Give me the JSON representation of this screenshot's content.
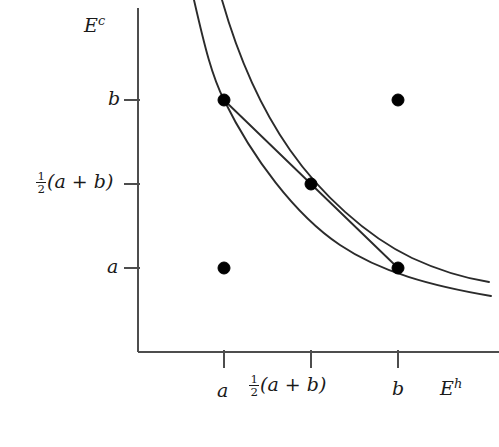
{
  "figure": {
    "type": "mathematical-diagram"
  },
  "axes": {
    "y_axis_label": "E",
    "y_axis_superscript": "c",
    "x_axis_label": "E",
    "x_axis_superscript": "h",
    "line_color": "#4d4d4d"
  },
  "yticks": [
    {
      "id": "b",
      "label": "b",
      "kind": "plain",
      "value_px": 100
    },
    {
      "id": "mid",
      "label": "(a + b)",
      "kind": "fraction",
      "numerator": "1",
      "denominator": "2",
      "value_px": 184
    },
    {
      "id": "a",
      "label": "a",
      "kind": "plain",
      "value_px": 268
    }
  ],
  "xticks": [
    {
      "id": "a",
      "label": "a",
      "kind": "plain",
      "value_px": 224
    },
    {
      "id": "mid",
      "label": "(a + b)",
      "kind": "fraction",
      "numerator": "1",
      "denominator": "2",
      "value_px": 311
    },
    {
      "id": "b",
      "label": "b",
      "kind": "plain",
      "value_px": 398
    }
  ],
  "chart_data": {
    "type": "line",
    "title": "",
    "xlabel": "E^h",
    "ylabel": "E^c",
    "grid": false,
    "legend": null,
    "axis_origin_px": {
      "x": 138,
      "y": 352
    },
    "axis_extent_px": {
      "x_end": 499,
      "y_top": 8
    },
    "tick_values": {
      "x": [
        "a",
        "1/2(a+b)",
        "b"
      ],
      "y": [
        "a",
        "1/2(a+b)",
        "b"
      ]
    },
    "points": [
      {
        "name": "point-a-b",
        "x_label": "a",
        "y_label": "b",
        "x_px": 224,
        "y_px": 100,
        "filled": true
      },
      {
        "name": "point-b-b",
        "x_label": "b",
        "y_label": "b",
        "x_px": 398,
        "y_px": 100,
        "filled": true
      },
      {
        "name": "point-mid-mid",
        "x_label": "1/2(a+b)",
        "y_label": "1/2(a+b)",
        "x_px": 311,
        "y_px": 184,
        "filled": true
      },
      {
        "name": "point-a-a",
        "x_label": "a",
        "y_label": "a",
        "x_px": 224,
        "y_px": 268,
        "filled": true
      },
      {
        "name": "point-b-a",
        "x_label": "b",
        "y_label": "a",
        "x_px": 398,
        "y_px": 268,
        "filled": true
      }
    ],
    "series": [
      {
        "name": "outer-hyperbola",
        "note": "hyperbola passing through (a,b) and (b,a)",
        "path": "M 194 0 C 205 48 212 76 224 100 C 252 157 295 215 340 245 C 380 272 432 286 491 296"
      },
      {
        "name": "inner-hyperbola",
        "note": "hyperbola tangent-like through midpoint (1/2(a+b), 1/2(a+b))",
        "path": "M 222 0 C 238 56 262 110 290 150 C 320 193 366 236 412 258 C 440 271 464 278 489 282"
      },
      {
        "name": "chord",
        "note": "straight secant line from (a,b) to (b,a)",
        "path": "M 224 100 L 398 268"
      }
    ],
    "curve_color": "#2b2b2b",
    "point_color": "#000000",
    "point_radius_px": 6
  }
}
